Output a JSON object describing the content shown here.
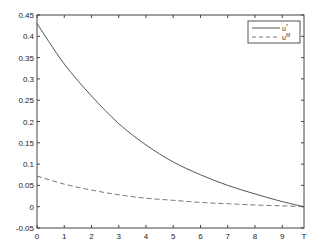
{
  "chart_data": {
    "type": "line",
    "title": "",
    "xlabel": "",
    "ylabel": "",
    "xlim": [
      0,
      9.8
    ],
    "ylim": [
      -0.05,
      0.45
    ],
    "x_ticks": [
      "0",
      "1",
      "2",
      "3",
      "4",
      "5",
      "6",
      "7",
      "8",
      "9",
      "T"
    ],
    "x_tick_values": [
      0,
      1,
      2,
      3,
      4,
      5,
      6,
      7,
      8,
      9,
      9.8
    ],
    "y_ticks": [
      "-0.05",
      "0",
      "0.05",
      "0.1",
      "0.15",
      "0.2",
      "0.25",
      "0.3",
      "0.35",
      "0.4",
      "0.45"
    ],
    "y_tick_values": [
      -0.05,
      0,
      0.05,
      0.1,
      0.15,
      0.2,
      0.25,
      0.3,
      0.35,
      0.4,
      0.45
    ],
    "grid": false,
    "legend_position": "top-right",
    "x": [
      0,
      1,
      2,
      3,
      4,
      5,
      6,
      7,
      8,
      9,
      9.8
    ],
    "series": [
      {
        "name": "u*",
        "style": "solid",
        "color": "#555555",
        "values": [
          0.43,
          0.335,
          0.26,
          0.195,
          0.145,
          0.105,
          0.075,
          0.05,
          0.03,
          0.012,
          0.0
        ]
      },
      {
        "name": "u^M",
        "style": "dashed",
        "color": "#777777",
        "values": [
          0.072,
          0.053,
          0.039,
          0.028,
          0.02,
          0.015,
          0.01,
          0.007,
          0.004,
          0.002,
          0.0
        ]
      }
    ],
    "legend": [
      {
        "label_base": "u",
        "label_sup": "*"
      },
      {
        "label_base": "u",
        "label_sup": "M"
      }
    ]
  }
}
